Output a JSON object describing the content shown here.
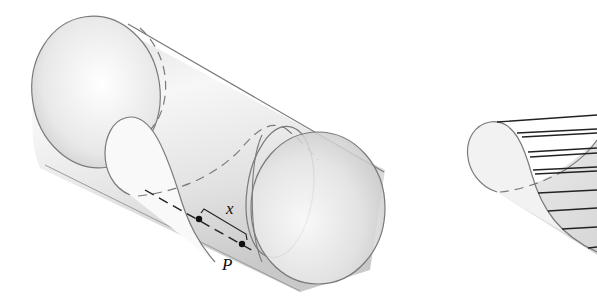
{
  "figure": {
    "labels": {
      "length": "x",
      "point": "P"
    },
    "colors": {
      "stroke": "#7a7a7a",
      "surface_light": "#f4f4f4",
      "surface_dark": "#cfcfcf",
      "ruling": "#222222",
      "point": "#111111"
    },
    "left_panel": {
      "shape": "cylinder",
      "points": [
        {
          "name": "start",
          "x": 199,
          "y": 219
        },
        {
          "name": "P",
          "x": 242,
          "y": 244
        }
      ]
    },
    "right_panel": {
      "shape": "ruled-surface-slice",
      "ruling_count": 11
    }
  }
}
